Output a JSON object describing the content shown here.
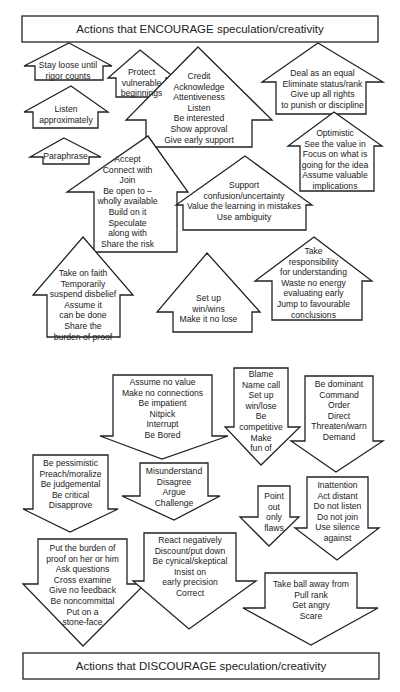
{
  "header": {
    "title": "Actions that ENCOURAGE speculation/creativity"
  },
  "footer": {
    "title": "Actions that DISCOURAGE speculation/creativity"
  },
  "encourage": [
    {
      "id": "stay-loose",
      "lines": [
        "Stay loose until",
        "rigor counts"
      ]
    },
    {
      "id": "protect",
      "lines": [
        "Protect",
        "vulnerable",
        "beginnings"
      ]
    },
    {
      "id": "credit",
      "lines": [
        "Credit",
        "Acknowledge",
        "Attentiveness",
        "Listen",
        "Be interested",
        "Show approval",
        "Give early support"
      ]
    },
    {
      "id": "deal-equal",
      "lines": [
        "Deal as an equal",
        "Eliminate status/rank",
        "Give up all rights",
        "to punish or discipline"
      ]
    },
    {
      "id": "listen-approx",
      "lines": [
        "Listen",
        "approximately"
      ]
    },
    {
      "id": "optimistic",
      "lines": [
        "Optimistic",
        "See the value in",
        "Focus on what is",
        "going for the idea",
        "Assume valuable",
        "implications"
      ]
    },
    {
      "id": "paraphrase",
      "lines": [
        "Paraphrase"
      ]
    },
    {
      "id": "accept",
      "lines": [
        "Accept",
        "Connect with",
        "Join",
        "Be open to –",
        "wholly available",
        "Build on it",
        "Speculate",
        "along with",
        "Share the risk"
      ]
    },
    {
      "id": "support",
      "lines": [
        "Support",
        "confusion/uncertainty",
        "Value the learning in mistakes",
        "Use ambiguity"
      ]
    },
    {
      "id": "take-faith",
      "lines": [
        "Take on faith",
        "Temporarily",
        "suspend disbelief",
        "Assume it",
        "can be done",
        "Share the",
        "burden of proof"
      ]
    },
    {
      "id": "win-wins",
      "lines": [
        "Set up",
        "win/wins",
        "Make it no lose"
      ]
    },
    {
      "id": "responsibility",
      "lines": [
        "Take",
        "responsibility",
        "for understanding",
        "Waste no energy",
        "evaluating early",
        "Jump to favourable",
        "conclusions"
      ]
    }
  ],
  "discourage": [
    {
      "id": "assume-no-value",
      "lines": [
        "Assume no value",
        "Make no connections",
        "Be impatient",
        "Nitpick",
        "Interrupt",
        "Be Bored"
      ]
    },
    {
      "id": "blame",
      "lines": [
        "Blame",
        "Name call",
        "Set up",
        "win/lose",
        "Be",
        "competitive",
        "Make",
        "fun of"
      ]
    },
    {
      "id": "dominant",
      "lines": [
        "Be dominant",
        "Command",
        "Order",
        "Direct",
        "Threaten/warn",
        "Demand"
      ]
    },
    {
      "id": "pessimistic",
      "lines": [
        "Be pessimistic",
        "Preach/moralize",
        "Be judgemental",
        "Be critical",
        "Disapprove"
      ]
    },
    {
      "id": "misunderstand",
      "lines": [
        "Misunderstand",
        "Disagree",
        "Argue",
        "Challenge"
      ]
    },
    {
      "id": "point-flaws",
      "lines": [
        "Point",
        "out",
        "only",
        "flaws"
      ]
    },
    {
      "id": "inattention",
      "lines": [
        "Inattention",
        "Act distant",
        "Do not listen",
        "Do not join",
        "Use silence",
        "against"
      ]
    },
    {
      "id": "burden",
      "lines": [
        "Put the burden of",
        "proof on her or him",
        "Ask questions",
        "Cross examine",
        "Give no feedback",
        "Be noncommittal",
        "Put on a",
        "stone-face"
      ]
    },
    {
      "id": "react-neg",
      "lines": [
        "React negatively",
        "Discount/put down",
        "Be cynical/skeptical",
        "Insist on",
        "early precision",
        "Correct"
      ]
    },
    {
      "id": "take-ball",
      "lines": [
        "Take ball away from",
        "Pull rank",
        "Get angry",
        "Scare"
      ]
    }
  ]
}
